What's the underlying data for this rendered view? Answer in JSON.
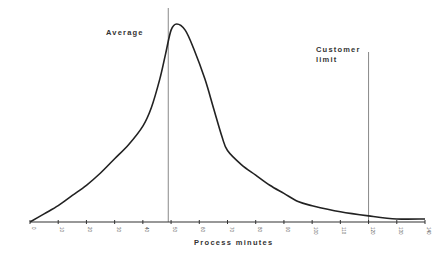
{
  "chart_data": {
    "type": "line",
    "title": "",
    "xlabel": "Process minutes",
    "ylabel": "",
    "xlim": [
      0,
      140
    ],
    "x_ticks": [
      0,
      10,
      20,
      30,
      40,
      50,
      60,
      70,
      80,
      90,
      100,
      110,
      120,
      130,
      140
    ],
    "grid": false,
    "legend": null,
    "series": [
      {
        "name": "Process time distribution",
        "x": [
          0,
          5,
          10,
          15,
          20,
          25,
          30,
          35,
          40,
          43,
          46,
          48,
          50,
          52,
          55,
          58,
          62,
          65,
          68,
          70,
          75,
          80,
          85,
          90,
          95,
          100,
          110,
          120,
          130,
          140
        ],
        "y": [
          0,
          4,
          8,
          13,
          18,
          24,
          31,
          38,
          47,
          56,
          70,
          82,
          94,
          97,
          94,
          85,
          70,
          56,
          42,
          35,
          28,
          23,
          18,
          14,
          10,
          8,
          5,
          3,
          1.5,
          1.5
        ]
      }
    ],
    "annotations": [
      {
        "type": "vline",
        "x": 49,
        "label": "Average"
      },
      {
        "type": "vline",
        "x": 120,
        "label": "Customer limit"
      }
    ]
  },
  "labels": {
    "average": "Average",
    "customer_limit_line1": "Customer",
    "customer_limit_line2": "limit",
    "xlabel": "Process minutes"
  },
  "colors": {
    "curve": "#222222",
    "axis": "#333333",
    "marker_line": "#888888"
  }
}
